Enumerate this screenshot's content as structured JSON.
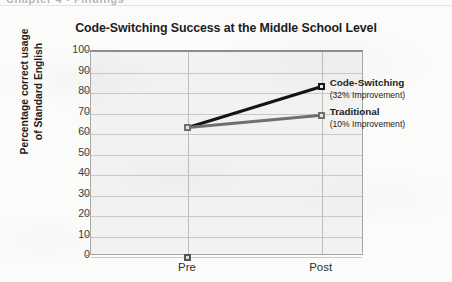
{
  "page_bleed_text": "Chapter 4 • Findings",
  "chart_data": {
    "type": "line",
    "title": "Code-Switching Success at the Middle School Level",
    "xlabel": "",
    "ylabel": "Percentage correct usage of Standard English",
    "ylabel_line1": "Percentage correct usage",
    "ylabel_line2": "of Standard English",
    "categories": [
      "Pre",
      "Post"
    ],
    "ylim": [
      0,
      100
    ],
    "ytick_step": 10,
    "yticks": [
      "100",
      "90",
      "80",
      "70",
      "60",
      "50",
      "40",
      "30",
      "20",
      "10",
      "0"
    ],
    "grid": true,
    "legend_position": "inline-right-annotations",
    "series": [
      {
        "name": "Code-Switching",
        "values": [
          63,
          83
        ],
        "color": "#141414",
        "annotation": "(32% Improvement)",
        "improvement_percent": 32
      },
      {
        "name": "Traditional",
        "values": [
          63,
          69
        ],
        "color": "#6f6f6f",
        "annotation": "(10% Improvement)",
        "improvement_percent": 10
      },
      {
        "name": "",
        "values": [
          0,
          null
        ],
        "color": "#555557",
        "annotation": "",
        "improvement_percent": null
      }
    ]
  }
}
